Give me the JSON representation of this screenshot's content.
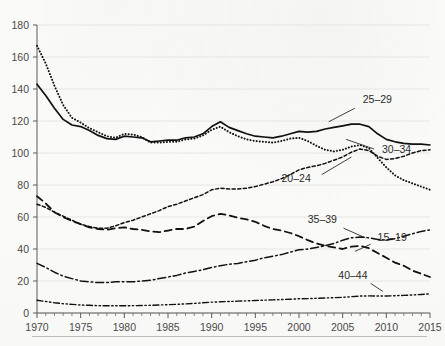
{
  "chart_data": {
    "type": "line",
    "title": "",
    "subtitle": "",
    "xlabel": "",
    "ylabel": "",
    "xlim": [
      1970,
      2015
    ],
    "ylim": [
      0,
      180
    ],
    "ytick_step": 20,
    "xtick_step": 5,
    "xminor_step": 1,
    "grid": "horizontal",
    "legend_position": "inline-annotations",
    "yticks": [
      0,
      20,
      40,
      60,
      80,
      100,
      120,
      140,
      160,
      180
    ],
    "xticks": [
      1970,
      1975,
      1980,
      1985,
      1990,
      1995,
      2000,
      2005,
      2010,
      2015
    ],
    "xtick_labels": [
      "1970",
      "1975",
      "1980",
      "1985",
      "1990",
      "1995",
      "2000",
      "2005",
      "2010",
      "2015"
    ],
    "ytick_labels": [
      "0",
      "20",
      "40",
      "60",
      "80",
      "100",
      "120",
      "140",
      "160",
      "180"
    ],
    "x": [
      1970,
      1971,
      1972,
      1973,
      1974,
      1975,
      1976,
      1977,
      1978,
      1979,
      1980,
      1981,
      1982,
      1983,
      1984,
      1985,
      1986,
      1987,
      1988,
      1989,
      1990,
      1991,
      1992,
      1993,
      1994,
      1995,
      1996,
      1997,
      1998,
      1999,
      2000,
      2001,
      2002,
      2003,
      2004,
      2005,
      2006,
      2007,
      2008,
      2009,
      2010,
      2011,
      2012,
      2013,
      2014,
      2015
    ],
    "series": [
      {
        "name": "25-29",
        "label": "25–29",
        "style": "solid",
        "color": "#111111",
        "label_x": 2007.3,
        "label_y": 131,
        "leader": [
          [
            2006.4,
            128.0
          ],
          [
            2003.4,
            119.5
          ]
        ],
        "values": [
          143.0,
          136.0,
          128.0,
          121.0,
          117.5,
          116.5,
          114.0,
          111.0,
          109.0,
          108.5,
          110.5,
          110.0,
          109.5,
          107.0,
          107.5,
          108.0,
          108.0,
          109.5,
          110.0,
          112.0,
          116.5,
          119.5,
          116.0,
          114.0,
          112.0,
          110.5,
          110.0,
          109.5,
          110.5,
          112.0,
          113.5,
          113.0,
          113.5,
          115.0,
          116.0,
          117.0,
          118.0,
          118.0,
          116.5,
          112.0,
          108.5,
          107.0,
          106.0,
          105.5,
          105.5,
          105.0
        ]
      },
      {
        "name": "20-24",
        "label": "20–24",
        "style": "dotted",
        "color": "#111111",
        "label_x": 1998.0,
        "label_y": 82,
        "leader": [
          [
            2002.6,
            86.5
          ],
          [
            2006.0,
            97.5
          ]
        ],
        "values": [
          167.0,
          156.0,
          142.0,
          130.0,
          122.0,
          119.0,
          115.5,
          113.0,
          110.5,
          109.5,
          112.0,
          111.5,
          110.0,
          106.5,
          106.5,
          107.0,
          107.0,
          108.5,
          109.0,
          111.0,
          114.5,
          116.5,
          113.0,
          110.5,
          108.5,
          107.5,
          107.0,
          106.5,
          107.5,
          109.0,
          109.5,
          107.5,
          104.5,
          102.0,
          101.0,
          102.0,
          104.0,
          105.0,
          103.0,
          97.0,
          91.0,
          86.0,
          83.0,
          81.0,
          79.0,
          77.0
        ]
      },
      {
        "name": "30-34",
        "label": "30–34",
        "style": "dashed-fine",
        "color": "#111111",
        "label_x": 2009.5,
        "label_y": 100,
        "leader": [
          [
            2008.6,
            102.5
          ],
          [
            2005.4,
            108.5
          ]
        ],
        "values": [
          68.0,
          66.0,
          63.0,
          60.5,
          58.0,
          55.5,
          54.0,
          53.0,
          53.0,
          54.5,
          56.5,
          58.0,
          60.0,
          62.0,
          64.0,
          66.5,
          68.0,
          70.0,
          72.0,
          74.0,
          77.0,
          78.0,
          77.5,
          77.5,
          78.0,
          79.0,
          80.5,
          82.0,
          84.0,
          86.5,
          89.5,
          91.0,
          92.0,
          93.5,
          95.5,
          97.5,
          100.5,
          102.5,
          101.5,
          98.0,
          96.0,
          96.5,
          98.0,
          100.0,
          101.5,
          102.0
        ]
      },
      {
        "name": "15-19",
        "label": "15–19",
        "style": "dashed-long",
        "color": "#111111",
        "label_x": 2009.0,
        "label_y": 45,
        "leader": [
          [
            2008.2,
            43.0
          ],
          [
            2006.4,
            38.5
          ]
        ],
        "values": [
          73.0,
          68.5,
          63.0,
          60.0,
          57.5,
          55.5,
          53.5,
          52.5,
          52.0,
          53.0,
          53.5,
          52.5,
          52.0,
          51.0,
          50.5,
          51.5,
          52.5,
          52.5,
          54.0,
          57.5,
          60.5,
          62.0,
          61.0,
          59.5,
          58.5,
          57.0,
          54.5,
          52.5,
          51.5,
          50.0,
          48.0,
          45.5,
          43.5,
          42.0,
          41.0,
          40.0,
          41.5,
          42.0,
          40.5,
          37.5,
          34.5,
          31.5,
          29.5,
          26.5,
          24.5,
          22.5
        ]
      },
      {
        "name": "35-39",
        "label": "35–39",
        "style": "dash-dot",
        "color": "#111111",
        "label_x": 2001.0,
        "label_y": 56,
        "leader": [
          [
            2005.1,
            53.0
          ],
          [
            2007.6,
            47.0
          ]
        ],
        "values": [
          31.0,
          28.5,
          25.5,
          23.0,
          21.5,
          20.0,
          19.5,
          19.0,
          19.0,
          19.5,
          19.5,
          19.5,
          20.0,
          20.5,
          21.5,
          22.5,
          23.5,
          25.0,
          26.0,
          27.0,
          28.5,
          29.5,
          30.5,
          31.0,
          32.0,
          33.0,
          34.5,
          35.5,
          36.5,
          38.0,
          39.5,
          40.0,
          41.0,
          42.0,
          43.5,
          45.5,
          47.0,
          47.5,
          47.0,
          46.0,
          45.5,
          46.5,
          48.0,
          49.5,
          51.0,
          52.0
        ]
      },
      {
        "name": "40-44",
        "label": "40–44",
        "style": "dash-dot-dot",
        "color": "#111111",
        "label_x": 2004.5,
        "label_y": 21,
        "leader": [
          [
            2008.2,
            18.5
          ],
          [
            2009.6,
            13.5
          ]
        ],
        "values": [
          8.0,
          7.2,
          6.4,
          5.8,
          5.4,
          5.0,
          4.8,
          4.6,
          4.5,
          4.5,
          4.5,
          4.6,
          4.7,
          4.8,
          5.0,
          5.2,
          5.4,
          5.7,
          6.0,
          6.4,
          6.8,
          7.0,
          7.2,
          7.4,
          7.6,
          7.8,
          8.0,
          8.2,
          8.4,
          8.6,
          8.9,
          9.0,
          9.2,
          9.4,
          9.6,
          9.8,
          10.2,
          10.6,
          10.7,
          10.6,
          10.6,
          10.8,
          11.0,
          11.3,
          11.6,
          12.0
        ]
      }
    ]
  },
  "plot": {
    "left_px": 37,
    "right_px": 430,
    "top_px": 25,
    "bottom_px": 313
  }
}
